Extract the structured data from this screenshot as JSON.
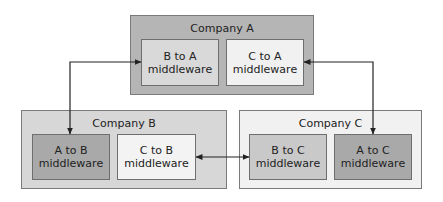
{
  "companies": {
    "a": {
      "title": "Company A",
      "fill": "#b5b5b5",
      "middleware": [
        {
          "line1": "B to A",
          "line2": "middleware",
          "fill": "#d9d9d9"
        },
        {
          "line1": "C to A",
          "line2": "middleware",
          "fill": "#f1f1f1"
        }
      ]
    },
    "b": {
      "title": "Company B",
      "fill": "#d7d7d7",
      "middleware": [
        {
          "line1": "A to B",
          "line2": "middleware",
          "fill": "#a9a9a9"
        },
        {
          "line1": "C to B",
          "line2": "middleware",
          "fill": "#f3f3f3"
        }
      ]
    },
    "c": {
      "title": "Company C",
      "fill": "#f1f1f1",
      "middleware": [
        {
          "line1": "B to C",
          "line2": "middleware",
          "fill": "#c9c9c9"
        },
        {
          "line1": "A to C",
          "line2": "middleware",
          "fill": "#a9a9a9"
        }
      ]
    }
  },
  "connections": [
    {
      "from": "B to A middleware",
      "to": "A to B middleware",
      "type": "bidirectional"
    },
    {
      "from": "C to A middleware",
      "to": "A to C middleware",
      "type": "bidirectional"
    },
    {
      "from": "C to B middleware",
      "to": "B to C middleware",
      "type": "bidirectional"
    }
  ]
}
